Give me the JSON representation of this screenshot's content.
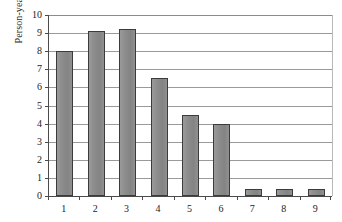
{
  "chart_data": {
    "type": "bar",
    "title": "",
    "subtitle": "",
    "xlabel": "",
    "ylabel": "Person-years",
    "categories": [
      "1",
      "2",
      "3",
      "4",
      "5",
      "6",
      "7",
      "8",
      "9"
    ],
    "values": [
      8.0,
      9.1,
      9.25,
      6.5,
      4.5,
      4.0,
      0.4,
      0.4,
      0.4
    ],
    "ylim": [
      0,
      10
    ],
    "yticks": [
      "0",
      "1",
      "2",
      "3",
      "4",
      "5",
      "6",
      "7",
      "8",
      "9",
      "10"
    ],
    "ytick_values": [
      0,
      1,
      2,
      3,
      4,
      5,
      6,
      7,
      8,
      9,
      10
    ],
    "grid": "horizontal",
    "legend": "none",
    "colors": {
      "bar_fill": "#8d8d8d",
      "bar_border": "#3b3b3b",
      "gridline": "#9a9a9a",
      "axis": "#4a4a4a",
      "background": "#ffffff",
      "text": "#1c1c1c"
    }
  }
}
